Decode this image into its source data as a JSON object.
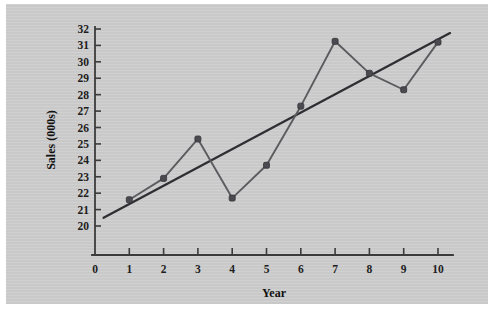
{
  "figure": {
    "background_color": "#c9c9c9",
    "page_color": "#ffffff",
    "ink_color": "#3b3b3b",
    "series_color": "#5c5c60",
    "trend_color": "#2f2f33"
  },
  "axes": {
    "x_title": "Year",
    "y_title": "Sales (000s)",
    "x_ticks": [
      "0",
      "1",
      "2",
      "3",
      "4",
      "5",
      "6",
      "7",
      "8",
      "9",
      "10"
    ],
    "y_ticks": [
      "20",
      "21",
      "22",
      "23",
      "24",
      "25",
      "26",
      "27",
      "28",
      "29",
      "30",
      "31",
      "32"
    ]
  },
  "chart_data": {
    "type": "line",
    "title": "",
    "subtitle": "",
    "xlabel": "Year",
    "ylabel": "Sales (000s)",
    "xlim": [
      0,
      10.5
    ],
    "ylim": [
      20,
      32
    ],
    "xticks": [
      0,
      1,
      2,
      3,
      4,
      5,
      6,
      7,
      8,
      9,
      10
    ],
    "yticks": [
      20,
      21,
      22,
      23,
      24,
      25,
      26,
      27,
      28,
      29,
      30,
      31,
      32
    ],
    "grid": false,
    "legend": null,
    "legend_position": "none",
    "x": [
      1,
      2,
      3,
      4,
      5,
      6,
      7,
      8,
      9,
      10
    ],
    "series": [
      {
        "name": "Sales (000s)",
        "type": "line",
        "markers": true,
        "color": "#5c5c60",
        "values": [
          21.6,
          22.9,
          25.3,
          21.7,
          23.7,
          27.3,
          31.25,
          29.3,
          28.3,
          31.2
        ]
      },
      {
        "name": "Linear trend line",
        "type": "line",
        "markers": false,
        "color": "#2f2f33",
        "x_endpoints": [
          0.25,
          10.35
        ],
        "y_endpoints": [
          20.5,
          31.75
        ]
      }
    ],
    "annotations": []
  }
}
